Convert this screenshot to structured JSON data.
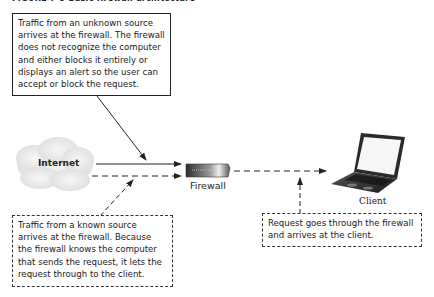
{
  "figure": {
    "title": "FIGURE 7-5 Basic firewall architecture"
  },
  "nodes": {
    "internet": {
      "label": "Internet",
      "icon": "cloud-icon"
    },
    "firewall": {
      "label": "Firewall",
      "icon": "firewall-device-icon"
    },
    "client": {
      "label": "Client",
      "icon": "laptop-icon"
    }
  },
  "callouts": {
    "unknown_source": "Traffic from an unknown source arrives at the firewall. The firewall does not recognize the computer and either blocks it entirely or displays an alert so the user can accept or block the request.",
    "known_source": "Traffic from a known source arrives at the firewall. Because the firewall knows the computer that sends the request, it lets the request through to the client.",
    "to_client": "Request goes through the firewall and arrives at the client."
  },
  "edges": [
    {
      "from": "internet",
      "to": "firewall",
      "style": "solid",
      "meaning": "unknown source traffic"
    },
    {
      "from": "internet",
      "to": "firewall",
      "style": "dashed",
      "meaning": "known source traffic"
    },
    {
      "from": "firewall",
      "to": "client",
      "style": "dashed",
      "meaning": "request passes through"
    }
  ],
  "colors": {
    "line": "#222222",
    "cloud": "#e6e6e6",
    "firewall_body": "#3a3a3a",
    "laptop_screen": "#f4f4f4",
    "laptop_body": "#2a2a2a"
  }
}
